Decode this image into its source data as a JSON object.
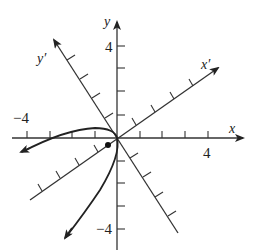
{
  "figure": {
    "type": "rotated-axes-parabola",
    "axes": {
      "x": {
        "label": "x",
        "tick_labels": {
          "min": "−4",
          "max": "4"
        }
      },
      "y": {
        "label": "y",
        "tick_labels": {
          "max": "4",
          "min": "−4"
        }
      },
      "x_prime": {
        "label": "x′"
      },
      "y_prime": {
        "label": "y′"
      }
    },
    "colors": {
      "ink": "#222222",
      "background": "#ffffff"
    },
    "annotations": {
      "curve": "parabola opening toward lower-left, vertex at origin",
      "focus_point": "dot near origin on curve axis"
    }
  }
}
